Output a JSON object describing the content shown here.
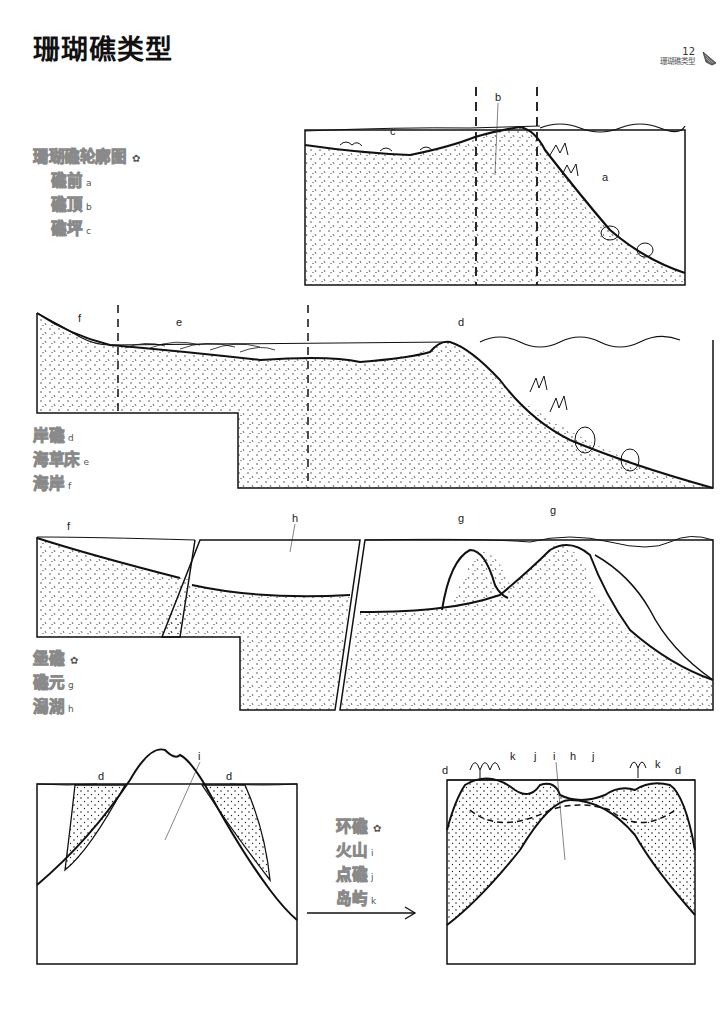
{
  "header": {
    "title": "珊瑚礁类型",
    "page_number": "12",
    "running_head": "珊瑚礁类型",
    "shell_icon": "shell-icon"
  },
  "legend_profile": {
    "heading": "珊瑚礁轮廓图",
    "heading_mark": "✿",
    "items": [
      {
        "label": "礁前",
        "letter": "a"
      },
      {
        "label": "礁顶",
        "letter": "b"
      },
      {
        "label": "礁坪",
        "letter": "c"
      }
    ]
  },
  "legend_fringing": {
    "items": [
      {
        "label": "岸礁",
        "letter": "d"
      },
      {
        "label": "海草床",
        "letter": "e"
      },
      {
        "label": "海岸",
        "letter": "f"
      }
    ]
  },
  "legend_barrier": {
    "heading": "堡礁",
    "heading_mark": "✿",
    "items": [
      {
        "label": "礁元",
        "letter": "g"
      },
      {
        "label": "潟湖",
        "letter": "h"
      }
    ]
  },
  "legend_atoll": {
    "heading": "环礁",
    "heading_mark": "✿",
    "items": [
      {
        "label": "火山",
        "letter": "i"
      },
      {
        "label": "点礁",
        "letter": "j"
      },
      {
        "label": "岛屿",
        "letter": "k"
      }
    ]
  },
  "figures": {
    "profile": {
      "labels": [
        "a",
        "b",
        "c"
      ]
    },
    "fringing": {
      "labels": [
        "d",
        "e",
        "f"
      ]
    },
    "barrier": {
      "labels": [
        "f",
        "h",
        "g",
        "g"
      ]
    },
    "volcano": {
      "labels": [
        "d",
        "i",
        "d"
      ]
    },
    "atoll": {
      "labels": [
        "d",
        "k",
        "j",
        "i",
        "h",
        "j",
        "k",
        "d"
      ]
    }
  },
  "colors": {
    "ink": "#111111",
    "legend_outline": "#8a8a8a",
    "background": "#ffffff"
  }
}
